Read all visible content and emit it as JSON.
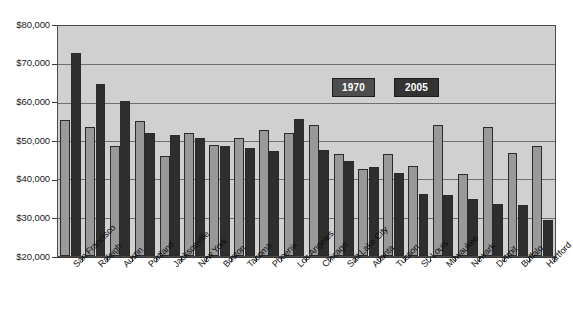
{
  "chart_data": {
    "type": "bar",
    "title": "",
    "xlabel": "",
    "ylabel": "",
    "ylim": [
      20000,
      80000
    ],
    "ytick_step": 10000,
    "ytick_labels": [
      "$20,000",
      "$30,000",
      "$40,000",
      "$50,000",
      "$60,000",
      "$70,000",
      "$80,000"
    ],
    "ytick_values": [
      20000,
      30000,
      40000,
      50000,
      60000,
      70000,
      80000
    ],
    "grid": true,
    "grid_axis": "y",
    "legend_position": "inside-top-center",
    "categories": [
      "San Francisco",
      "Raleigh",
      "Austin",
      "Portland",
      "Jacksonville",
      "New York",
      "Boston",
      "Tacoma",
      "Phoenix",
      "Los Angeles",
      "Chicago",
      "Salt Lake City",
      "Atlanta",
      "Tucson",
      "St. Louis",
      "Milwaukee",
      "Newark",
      "Detroit",
      "Buffalo",
      "Hartford"
    ],
    "series": [
      {
        "name": "1970",
        "color": "#999999",
        "values": [
          55500,
          53600,
          48800,
          55200,
          46200,
          52100,
          48900,
          50800,
          53000,
          52200,
          54100,
          46700,
          42600,
          46600,
          43400,
          54200,
          41300,
          53600,
          47000,
          48700
        ]
      },
      {
        "name": "2005",
        "color": "#2e2e2e",
        "values": [
          73000,
          64900,
          60500,
          52200,
          51600,
          50900,
          48800,
          48300,
          47500,
          55700,
          47700,
          44700,
          43100,
          41600,
          36200,
          36000,
          34900,
          33600,
          33200,
          29300
        ]
      }
    ]
  },
  "legend": {
    "items": [
      {
        "label": "1970",
        "color": "#4d4d4d"
      },
      {
        "label": "2005",
        "color": "#333333"
      }
    ]
  },
  "axes": {
    "y": {
      "labels": [
        "$80,000",
        "$70,000",
        "$60,000",
        "$50,000",
        "$40,000",
        "$30,000",
        "$20,000"
      ]
    }
  },
  "colors": {
    "plot_background": "#d0d0d0",
    "gridline": "#6e6e6e",
    "axis": "#3a3a3a",
    "series_1970": "#999999",
    "series_2005": "#2e2e2e",
    "page_background": "#ffffff"
  }
}
